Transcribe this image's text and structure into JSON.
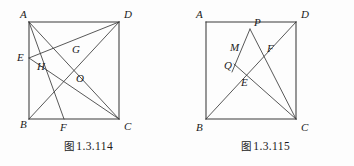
{
  "page": {
    "background": "#fdfdfd",
    "ink_color": "#3a3a3a",
    "label_color": "#1b1b1b"
  },
  "figures": [
    {
      "id": "figure-114",
      "caption_cn": "图",
      "caption_num": "1.3.114",
      "square_vertices": [
        "A",
        "D",
        "C",
        "B"
      ],
      "points": [
        {
          "name": "A",
          "label": "A",
          "x": 29,
          "y": 22,
          "lx": 20,
          "ly": 18
        },
        {
          "name": "D",
          "label": "D",
          "x": 119,
          "y": 22,
          "lx": 124,
          "ly": 18
        },
        {
          "name": "B",
          "label": "B",
          "x": 29,
          "y": 119,
          "lx": 20,
          "ly": 128
        },
        {
          "name": "C",
          "label": "C",
          "x": 119,
          "y": 119,
          "lx": 124,
          "ly": 130
        },
        {
          "name": "E",
          "label": "E",
          "x": 29,
          "y": 58,
          "lx": 18,
          "ly": 61
        },
        {
          "name": "F",
          "label": "F",
          "x": 64,
          "y": 119,
          "lx": 60,
          "ly": 131
        },
        {
          "name": "G",
          "label": "G",
          "x": 70,
          "y": 52,
          "lx": 72,
          "ly": 52
        },
        {
          "name": "H",
          "label": "H",
          "x": 45,
          "y": 62,
          "lx": 37,
          "ly": 70
        },
        {
          "name": "O",
          "label": "O",
          "x": 74,
          "y": 77,
          "lx": 76,
          "ly": 82
        }
      ],
      "segments": [
        {
          "name": "side-AD",
          "from": "A",
          "to": "D",
          "kind": "edge"
        },
        {
          "name": "side-DC",
          "from": "D",
          "to": "C",
          "kind": "edge"
        },
        {
          "name": "side-CB",
          "from": "C",
          "to": "B",
          "kind": "edge"
        },
        {
          "name": "side-BA",
          "from": "B",
          "to": "A",
          "kind": "edge"
        },
        {
          "name": "diagonal-AC",
          "from": "A",
          "to": "C",
          "kind": "chord"
        },
        {
          "name": "diagonal-BD",
          "from": "B",
          "to": "D",
          "kind": "chord"
        },
        {
          "name": "segment-AF",
          "from": "A",
          "to": "F",
          "kind": "chord"
        },
        {
          "name": "segment-ED",
          "from": "E",
          "to": "D",
          "kind": "chord"
        },
        {
          "name": "segment-EC",
          "from": "E",
          "to": "C",
          "kind": "chord"
        }
      ]
    },
    {
      "id": "figure-115",
      "caption_cn": "图",
      "caption_num": "1.3.115",
      "square_vertices": [
        "A",
        "D",
        "C",
        "B"
      ],
      "points": [
        {
          "name": "A",
          "label": "A",
          "x": 29,
          "y": 22,
          "lx": 19,
          "ly": 18
        },
        {
          "name": "D",
          "label": "D",
          "x": 119,
          "y": 22,
          "lx": 124,
          "ly": 18
        },
        {
          "name": "B",
          "label": "B",
          "x": 29,
          "y": 119,
          "lx": 19,
          "ly": 131
        },
        {
          "name": "C",
          "label": "C",
          "x": 119,
          "y": 119,
          "lx": 124,
          "ly": 131
        },
        {
          "name": "P",
          "label": "P",
          "x": 73,
          "y": 29,
          "lx": 77,
          "ly": 26
        },
        {
          "name": "M",
          "label": "M",
          "x": 64,
          "y": 49,
          "lx": 54,
          "ly": 50
        },
        {
          "name": "F",
          "label": "F",
          "x": 86,
          "y": 49,
          "lx": 90,
          "ly": 51
        },
        {
          "name": "Q",
          "label": "Q",
          "x": 59,
          "y": 66,
          "lx": 48,
          "ly": 68
        },
        {
          "name": "E",
          "label": "E",
          "x": 62,
          "y": 76,
          "lx": 65,
          "ly": 85
        }
      ],
      "segments": [
        {
          "name": "side-AD",
          "from": "A",
          "to": "D",
          "kind": "edge"
        },
        {
          "name": "side-DC",
          "from": "D",
          "to": "C",
          "kind": "edge"
        },
        {
          "name": "side-CB",
          "from": "C",
          "to": "B",
          "kind": "edge"
        },
        {
          "name": "side-BA",
          "from": "B",
          "to": "A",
          "kind": "edge"
        },
        {
          "name": "diagonal-BD",
          "from": "B",
          "to": "D",
          "kind": "chord"
        },
        {
          "name": "segment-PC",
          "from": "P",
          "to": "C",
          "kind": "chord"
        },
        {
          "name": "segment-PQ",
          "from": "P",
          "to": "Q",
          "kind": "chord"
        },
        {
          "name": "segment-QC",
          "from": "Q",
          "to": "C",
          "kind": "chord"
        }
      ]
    }
  ]
}
